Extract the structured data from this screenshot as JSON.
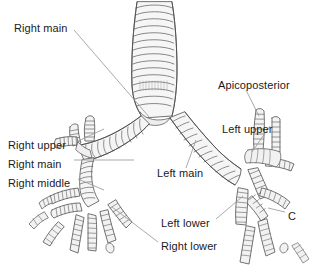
{
  "figure": {
    "style": "pencil line drawing",
    "width": 311,
    "height": 272,
    "background_color": "#ffffff",
    "ink_color": "#555555",
    "fill_color": "#f2f2f2",
    "text_color": "#1a1a1a",
    "leader_color": "#8c8c8c"
  },
  "labels": [
    {
      "id": "right-main-upper",
      "text": "Right main",
      "x": 14,
      "y": 28,
      "anchor": "start"
    },
    {
      "id": "apicoposterior",
      "text": "Apicoposterior",
      "x": 218,
      "y": 85,
      "anchor": "start"
    },
    {
      "id": "right-upper",
      "text": "Right upper",
      "x": 8,
      "y": 145,
      "anchor": "start"
    },
    {
      "id": "left-upper",
      "text": "Left upper",
      "x": 222,
      "y": 129,
      "anchor": "start"
    },
    {
      "id": "right-main-lower",
      "text": "Right main",
      "x": 8,
      "y": 164,
      "anchor": "start"
    },
    {
      "id": "left-main",
      "text": "Left main",
      "x": 157,
      "y": 173,
      "anchor": "start"
    },
    {
      "id": "right-middle",
      "text": "Right middle",
      "x": 8,
      "y": 183,
      "anchor": "start"
    },
    {
      "id": "left-lower",
      "text": "Left lower",
      "x": 161,
      "y": 223,
      "anchor": "start"
    },
    {
      "id": "right-lower",
      "text": "Right lower",
      "x": 161,
      "y": 246,
      "anchor": "start"
    },
    {
      "id": "marker-c",
      "text": "C",
      "x": 288,
      "y": 216,
      "anchor": "start"
    }
  ]
}
